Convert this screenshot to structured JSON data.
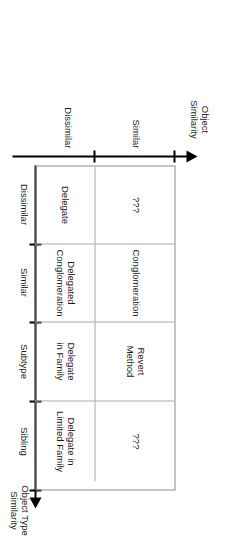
{
  "figure": {
    "axes": {
      "horizontal": {
        "name": "object-similarity-axis",
        "title": "Object\nSimilarity",
        "arrow_direction": "left",
        "segments": [
          {
            "label": "Similar"
          },
          {
            "label": "Dissimilar"
          }
        ]
      },
      "vertical": {
        "name": "object-type-similarity-axis",
        "title": "Object Type\nSimilarity",
        "arrow_direction": "down",
        "segments": [
          {
            "label": "Dissimilar"
          },
          {
            "label": "Similar"
          },
          {
            "label": "Subtype"
          },
          {
            "label": "Sibling"
          }
        ]
      }
    },
    "matrix": {
      "rows": [
        {
          "row_label": "Similar",
          "cells": [
            {
              "text": "???"
            },
            {
              "text": "Conglomeration"
            },
            {
              "text": "Revert\nMethod"
            },
            {
              "text": "???"
            }
          ]
        },
        {
          "row_label": "Dissimilar",
          "cells": [
            {
              "text": "Delegate"
            },
            {
              "text": "Delegated\nConglomeration"
            },
            {
              "text": "Delegate\nin Family"
            },
            {
              "text": "Delegate in\nLimited Family"
            }
          ]
        }
      ],
      "column_labels": [
        "Dissimilar",
        "Similar",
        "Subtype",
        "Sibling"
      ]
    },
    "colors": {
      "axis": "#000000",
      "grid_line": "#a9a9a9",
      "border": "#8c8c8c",
      "text": "#1a1a1a",
      "background": "#ffffff"
    }
  }
}
